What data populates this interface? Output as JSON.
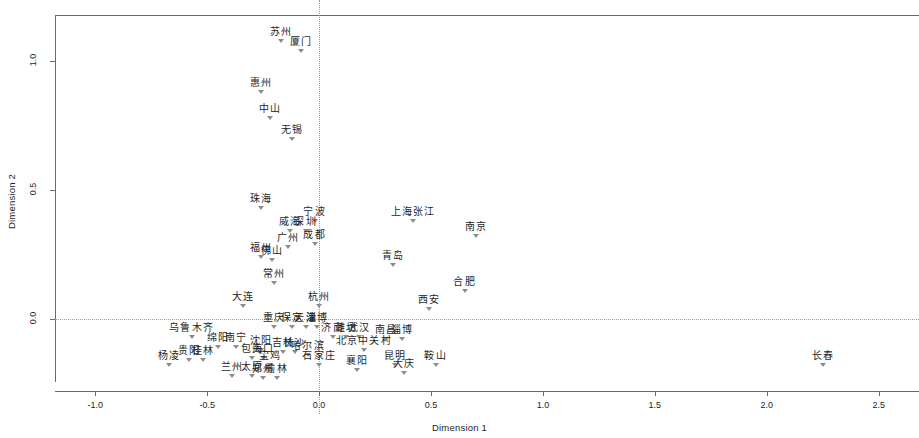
{
  "chart_data": {
    "type": "scatter",
    "title": "",
    "xlabel": "Dimension 1",
    "ylabel": "Dimension 2",
    "xlim": [
      -1.18,
      2.68
    ],
    "ylim": [
      -0.28,
      1.18
    ],
    "xticks": [
      "-1.0",
      "-0.5",
      "0.0",
      "0.5",
      "1.0",
      "1.5",
      "2.0",
      "2.5"
    ],
    "xtickvalues": [
      -1.0,
      -0.5,
      0.0,
      0.5,
      1.0,
      1.5,
      2.0,
      2.5
    ],
    "yticks": [
      "0.0",
      "0.5",
      "1.0"
    ],
    "ytickvalues": [
      0.0,
      0.5,
      1.0
    ],
    "grid": false,
    "legend": false,
    "reference_lines": {
      "vertical_at_x": 0.0,
      "horizontal_at_y": 0.0,
      "style": "dotted"
    },
    "marker": "triangle-down",
    "points": [
      {
        "label": "苏州",
        "x": -0.17,
        "y": 1.08
      },
      {
        "label": "厦门",
        "x": -0.08,
        "y": 1.04
      },
      {
        "label": "惠州",
        "x": -0.26,
        "y": 0.88
      },
      {
        "label": "中山",
        "x": -0.22,
        "y": 0.78
      },
      {
        "label": "无锡",
        "x": -0.12,
        "y": 0.7
      },
      {
        "label": "珠海",
        "x": -0.26,
        "y": 0.43
      },
      {
        "label": "宁波",
        "x": -0.02,
        "y": 0.38
      },
      {
        "label": "上海张江",
        "x": 0.42,
        "y": 0.38
      },
      {
        "label": "威海",
        "x": -0.13,
        "y": 0.34
      },
      {
        "label": "深圳",
        "x": -0.06,
        "y": 0.34
      },
      {
        "label": "南京",
        "x": 0.7,
        "y": 0.32
      },
      {
        "label": "广州",
        "x": -0.14,
        "y": 0.28
      },
      {
        "label": "成都",
        "x": -0.02,
        "y": 0.29
      },
      {
        "label": "福州",
        "x": -0.26,
        "y": 0.24
      },
      {
        "label": "佛山",
        "x": -0.21,
        "y": 0.23
      },
      {
        "label": "青岛",
        "x": 0.33,
        "y": 0.21
      },
      {
        "label": "常州",
        "x": -0.2,
        "y": 0.14
      },
      {
        "label": "合肥",
        "x": 0.65,
        "y": 0.11
      },
      {
        "label": "大连",
        "x": -0.34,
        "y": 0.05
      },
      {
        "label": "杭州",
        "x": 0.0,
        "y": 0.05
      },
      {
        "label": "西安",
        "x": 0.49,
        "y": 0.04
      },
      {
        "label": "重庆",
        "x": -0.2,
        "y": -0.03
      },
      {
        "label": "保定",
        "x": -0.12,
        "y": -0.03
      },
      {
        "label": "天津",
        "x": -0.06,
        "y": -0.03
      },
      {
        "label": "淄博",
        "x": -0.01,
        "y": -0.03
      },
      {
        "label": "乌鲁木齐",
        "x": -0.57,
        "y": -0.07
      },
      {
        "label": "济南",
        "x": 0.06,
        "y": -0.07
      },
      {
        "label": "潍坊",
        "x": 0.12,
        "y": -0.07
      },
      {
        "label": "武汉",
        "x": 0.18,
        "y": -0.07
      },
      {
        "label": "南昌",
        "x": 0.3,
        "y": -0.08
      },
      {
        "label": "淄博",
        "x": 0.37,
        "y": -0.08
      },
      {
        "label": "绵阳",
        "x": -0.45,
        "y": -0.11
      },
      {
        "label": "南宁",
        "x": -0.37,
        "y": -0.11
      },
      {
        "label": "沈阳",
        "x": -0.26,
        "y": -0.12
      },
      {
        "label": "北京中关村",
        "x": 0.2,
        "y": -0.12
      },
      {
        "label": "长沙",
        "x": -0.11,
        "y": -0.13
      },
      {
        "label": "吉林",
        "x": -0.16,
        "y": -0.13
      },
      {
        "label": "哈尔滨",
        "x": -0.05,
        "y": -0.14
      },
      {
        "label": "包头",
        "x": -0.3,
        "y": -0.15
      },
      {
        "label": "海口",
        "x": -0.25,
        "y": -0.15
      },
      {
        "label": "贵阳",
        "x": -0.58,
        "y": -0.16
      },
      {
        "label": "桂林",
        "x": -0.52,
        "y": -0.16
      },
      {
        "label": "杨凌",
        "x": -0.67,
        "y": -0.18
      },
      {
        "label": "石家庄",
        "x": 0.0,
        "y": -0.18
      },
      {
        "label": "宝鸡",
        "x": -0.22,
        "y": -0.18
      },
      {
        "label": "昆明",
        "x": 0.34,
        "y": -0.18
      },
      {
        "label": "鞍山",
        "x": 0.52,
        "y": -0.18
      },
      {
        "label": "长春",
        "x": 2.25,
        "y": -0.18
      },
      {
        "label": "襄阳",
        "x": 0.17,
        "y": -0.2
      },
      {
        "label": "大庆",
        "x": 0.38,
        "y": -0.21
      },
      {
        "label": "兰州",
        "x": -0.39,
        "y": -0.22
      },
      {
        "label": "太原",
        "x": -0.3,
        "y": -0.22
      },
      {
        "label": "郑州",
        "x": -0.25,
        "y": -0.23
      },
      {
        "label": "榆林",
        "x": -0.19,
        "y": -0.23
      }
    ]
  }
}
